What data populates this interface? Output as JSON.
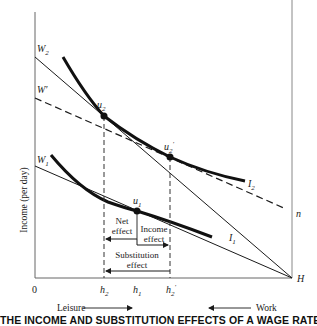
{
  "diagram": {
    "y_axis_label": "Income (per day)",
    "origin_label": "0",
    "corner_label": "H",
    "line_labels": {
      "w2": "W",
      "w2_sub": "2",
      "wprime": "W′",
      "w1": "W",
      "w1_sub": "1",
      "n": "n"
    },
    "curve_labels": {
      "i2": "I",
      "i2_sub": "2",
      "i1": "I",
      "i1_sub": "1"
    },
    "points": {
      "u2": "u",
      "u2_sub": "2",
      "u2prime": "u",
      "u2prime_sub": "2",
      "u2prime_sup": "′",
      "u1": "u",
      "u1_sub": "1"
    },
    "x_ticks": {
      "h2": "h",
      "h2_sub": "2",
      "h1": "h",
      "h1_sub": "1",
      "h2prime": "h",
      "h2prime_sub": "2",
      "h2prime_sup": "′"
    },
    "effects": {
      "net_line1": "Net",
      "net_line2": "effect",
      "income_line1": "Income",
      "income_line2": "effect",
      "substitution_line1": "Substitution",
      "substitution_line2": "effect"
    },
    "direction_labels": {
      "leisure": "Leisure",
      "work": "Work"
    },
    "title": "THE INCOME AND SUBSTITUTION EFFECTS OF A WAGE RATE INCREASE"
  },
  "colors": {
    "ink": "#1a1a1a",
    "axis": "#555555",
    "background": "#ffffff"
  }
}
